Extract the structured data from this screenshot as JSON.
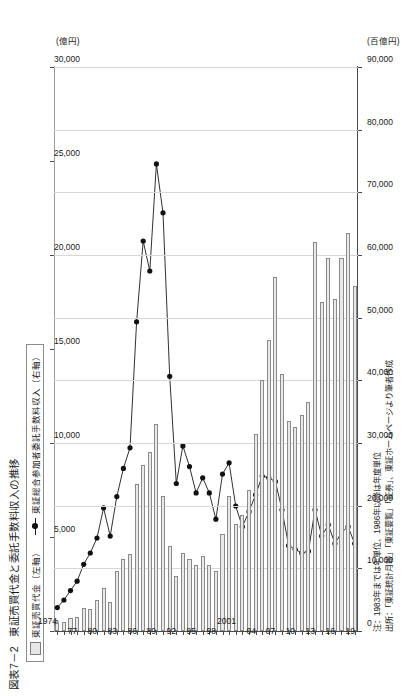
{
  "figure": {
    "number": "図表7－2",
    "title": "東証売買代金と委託手数料収入の推移"
  },
  "legend": {
    "position": "top-left",
    "bar_label": "東証売買代金（左軸）",
    "line_label": "東証総合参加者委託手数料収入（右軸）"
  },
  "axes": {
    "left_unit": "(百億円)",
    "right_unit": "(億円)",
    "left_ticks": [
      "0",
      "10,000",
      "20,000",
      "30,000",
      "40,000",
      "50,000",
      "60,000",
      "70,000",
      "80,000",
      "90,000"
    ],
    "right_ticks": [
      "0",
      "5,000",
      "10,000",
      "15,000",
      "20,000",
      "25,000",
      "30,000"
    ],
    "year_ticks": [
      "1974",
      "77",
      "80",
      "83",
      "86",
      "89",
      "92",
      "95",
      "98",
      "2001",
      "04",
      "07",
      "10",
      "13",
      "16",
      "19"
    ]
  },
  "notes": {
    "note": "注：1983年までは年単位、1986年以降は年度単位",
    "source": "出所：「東証統計月報」「東証要覧」「証券」、東証ホームページより筆者作成"
  },
  "colors": {
    "bar_fill": "#e9e9e9",
    "bar_stroke": "#8a8a8a",
    "line": "#1a1a1a",
    "marker": "#111111",
    "grid": "#d7d7d7",
    "axis": "#4a4a4a"
  },
  "chart_data": {
    "type": "bar",
    "title": "東証売買代金と委託手数料収入の推移",
    "xlabel": "",
    "ylabel": "東証売買代金（百億円） / 委託手数料収入（億円）",
    "orientation": "vertical",
    "grid": true,
    "legend_position": "top-left",
    "ylim": [
      0,
      90000
    ],
    "y2lim": [
      0,
      30000
    ],
    "categories": [
      "1974",
      "1975",
      "1976",
      "1977",
      "1978",
      "1979",
      "1980",
      "1981",
      "1982",
      "1983",
      "1984",
      "1985",
      "1986",
      "1987",
      "1988",
      "1989",
      "1990",
      "1991",
      "1992",
      "1993",
      "1994",
      "1995",
      "1996",
      "1997",
      "1998",
      "1999",
      "2000",
      "2001",
      "2002",
      "2003",
      "2004",
      "2005",
      "2006",
      "2007",
      "2008",
      "2009",
      "2010",
      "2011",
      "2012",
      "2013",
      "2014",
      "2015",
      "2016",
      "2017",
      "2018",
      "2019"
    ],
    "series": [
      {
        "name": "東証売買代金（左軸）",
        "axis": "left",
        "unit": "百億円",
        "type": "bar",
        "values": [
          1300,
          1500,
          2100,
          2200,
          3600,
          3500,
          4900,
          6800,
          4600,
          9500,
          11500,
          12300,
          23500,
          26500,
          28500,
          33000,
          21500,
          13500,
          8800,
          12500,
          11500,
          10500,
          12000,
          10500,
          9500,
          15500,
          21500,
          17000,
          18500,
          22500,
          31500,
          40000,
          46500,
          56500,
          41000,
          33500,
          32500,
          34500,
          36500,
          62000,
          52500,
          59500,
          53000,
          59500,
          63500,
          55000
        ]
      },
      {
        "name": "東証総合参加者委託手数料収入（右軸）",
        "axis": "right",
        "unit": "億円",
        "type": "line",
        "values": [
          1300,
          1700,
          2200,
          2700,
          3600,
          4200,
          5000,
          6600,
          5100,
          7200,
          8700,
          9800,
          16500,
          20800,
          19200,
          24900,
          22300,
          13600,
          7900,
          9900,
          8800,
          7400,
          8200,
          7400,
          6000,
          8400,
          9000,
          6700,
          5600,
          6400,
          7300,
          8300,
          8200,
          8000,
          6500,
          4600,
          4400,
          4200,
          4300,
          6500,
          5100,
          5700,
          4700,
          5300,
          5600,
          4700
        ]
      }
    ]
  }
}
